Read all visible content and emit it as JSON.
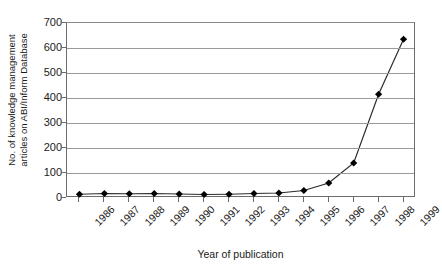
{
  "chart_data": {
    "type": "line",
    "title": "",
    "xlabel": "Year of publication",
    "ylabel": "No. of knowledge management articles on ABI/Inform Database",
    "ylabel_lines": [
      "No. of knowledge management",
      "articles on ABI/Inform Database"
    ],
    "categories": [
      "1986",
      "1987",
      "1988",
      "1989",
      "1990",
      "1991",
      "1992",
      "1993",
      "1994",
      "1995",
      "1996",
      "1997",
      "1998",
      "1999"
    ],
    "values": [
      15,
      18,
      17,
      18,
      16,
      14,
      15,
      18,
      20,
      30,
      60,
      140,
      415,
      635
    ],
    "ylim": [
      0,
      700
    ],
    "yticks": [
      0,
      100,
      200,
      300,
      400,
      500,
      600,
      700
    ],
    "ytick_labels": [
      "0",
      "100",
      "200",
      "300",
      "400",
      "500",
      "600",
      "700"
    ],
    "grid": true,
    "grid_axis": "y",
    "legend": false,
    "marker": "diamond",
    "marker_color": "#000000",
    "line_color": "#2b2b2b",
    "grid_color": "#9a9a9a",
    "axis_color": "#6b6b6b",
    "background": "#ffffff"
  }
}
